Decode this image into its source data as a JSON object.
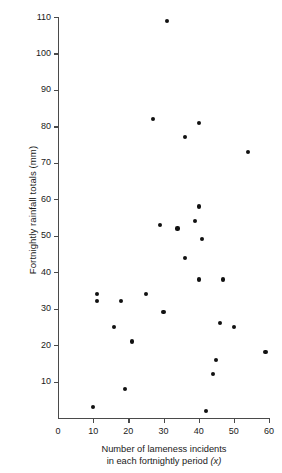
{
  "chart_data": {
    "type": "scatter",
    "title": "",
    "xlabel": "Number of lameness incidents in each fortnightly period (x)",
    "xlabel_line1": "Number of lameness incidents",
    "xlabel_line2_prefix": "in each fortnightly period",
    "xlabel_line2_var": "(x)",
    "ylabel": "Fortnightly rainfall totals (mm)",
    "xlim": [
      0,
      60
    ],
    "ylim": [
      0,
      110
    ],
    "xticks": [
      0,
      10,
      20,
      30,
      40,
      50,
      60
    ],
    "yticks": [
      10,
      20,
      30,
      40,
      50,
      60,
      70,
      80,
      90,
      100,
      110
    ],
    "xtick_labels": [
      "0",
      "10",
      "20",
      "30",
      "40",
      "50",
      "60"
    ],
    "ytick_labels": [
      "10",
      "20",
      "30",
      "40",
      "50",
      "60",
      "70",
      "80",
      "90",
      "100",
      "110"
    ],
    "grid": false,
    "legend": false,
    "marker": "filled-circle",
    "marker_color": "#111111",
    "axis_color": "#4a4a4a",
    "background_color": "#ffffff",
    "points": [
      {
        "x": 31,
        "y": 109
      },
      {
        "x": 27,
        "y": 82
      },
      {
        "x": 40,
        "y": 81
      },
      {
        "x": 36,
        "y": 77
      },
      {
        "x": 54,
        "y": 73
      },
      {
        "x": 40,
        "y": 58
      },
      {
        "x": 34,
        "y": 52
      },
      {
        "x": 39,
        "y": 54
      },
      {
        "x": 41,
        "y": 49
      },
      {
        "x": 29,
        "y": 53
      },
      {
        "x": 36,
        "y": 44
      },
      {
        "x": 40,
        "y": 38
      },
      {
        "x": 47,
        "y": 38
      },
      {
        "x": 25,
        "y": 34
      },
      {
        "x": 11,
        "y": 34
      },
      {
        "x": 11,
        "y": 32
      },
      {
        "x": 18,
        "y": 32
      },
      {
        "x": 30,
        "y": 29
      },
      {
        "x": 46,
        "y": 26
      },
      {
        "x": 50,
        "y": 25
      },
      {
        "x": 16,
        "y": 25
      },
      {
        "x": 21,
        "y": 21
      },
      {
        "x": 59,
        "y": 18
      },
      {
        "x": 45,
        "y": 16
      },
      {
        "x": 44,
        "y": 12
      },
      {
        "x": 19,
        "y": 8
      },
      {
        "x": 42,
        "y": 2
      },
      {
        "x": 10,
        "y": 3
      }
    ]
  },
  "figure": {
    "plot_area_label": "scatter-plot"
  }
}
